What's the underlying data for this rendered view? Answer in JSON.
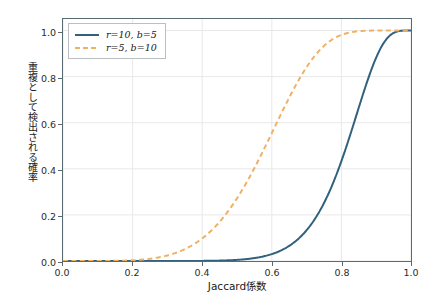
{
  "chart_data": {
    "type": "line",
    "title": "",
    "xlabel": "Jaccard係数",
    "ylabel": "重複として検出される確率",
    "xlim": [
      0.0,
      1.0
    ],
    "ylim": [
      0.0,
      1.05
    ],
    "grid": true,
    "legend_position": "upper left",
    "xticks": [
      "0.0",
      "0.2",
      "0.4",
      "0.6",
      "0.8",
      "1.0"
    ],
    "xtick_values": [
      0.0,
      0.2,
      0.4,
      0.6,
      0.8,
      1.0
    ],
    "yticks": [
      "0.0",
      "0.2",
      "0.4",
      "0.6",
      "0.8",
      "1.0"
    ],
    "ytick_values": [
      0.0,
      0.2,
      0.4,
      0.6,
      0.8,
      1.0
    ],
    "x": [
      0.0,
      0.05,
      0.1,
      0.15,
      0.2,
      0.25,
      0.3,
      0.35,
      0.4,
      0.45,
      0.5,
      0.55,
      0.6,
      0.65,
      0.7,
      0.75,
      0.8,
      0.85,
      0.9,
      0.95,
      1.0
    ],
    "series": [
      {
        "name": "r=10, b=5",
        "label": "r=10, b=5",
        "color": "#31617d",
        "linestyle": "solid",
        "linewidth": 2.0,
        "formula": "1-(1-s^10)^5",
        "threshold": 0.85,
        "values": [
          0.0,
          0.0,
          0.0,
          0.0,
          0.0,
          0.0,
          0.0,
          0.0,
          0.001,
          0.002,
          0.005,
          0.012,
          0.03,
          0.066,
          0.133,
          0.248,
          0.423,
          0.648,
          0.87,
          0.987,
          1.0
        ]
      },
      {
        "name": "r=5, b=10",
        "label": "r=5, b=10",
        "color": "#f0b163",
        "linestyle": "dashed",
        "linewidth": 2.0,
        "formula": "1-(1-s^5)^10",
        "threshold": 0.63,
        "values": [
          0.0,
          0.0,
          0.0,
          0.001,
          0.003,
          0.01,
          0.024,
          0.051,
          0.097,
          0.169,
          0.271,
          0.404,
          0.556,
          0.708,
          0.838,
          0.928,
          0.977,
          0.996,
          1.0,
          1.0,
          1.0
        ]
      }
    ]
  },
  "legend": {
    "entries": [
      {
        "label": "r=10, b=5",
        "color": "#31617d",
        "style": "solid"
      },
      {
        "label": "r=5, b=10",
        "color": "#f0b163",
        "style": "dashed"
      }
    ]
  },
  "axes": {
    "x_title": "Jaccard係数",
    "y_title": "重複として検出される確率",
    "x_tick_0": "0.0",
    "x_tick_1": "0.2",
    "x_tick_2": "0.4",
    "x_tick_3": "0.6",
    "x_tick_4": "0.8",
    "x_tick_5": "1.0",
    "y_tick_0": "0.0",
    "y_tick_1": "0.2",
    "y_tick_2": "0.4",
    "y_tick_3": "0.6",
    "y_tick_4": "0.8",
    "y_tick_5": "1.0"
  },
  "colors": {
    "series_1": "#31617d",
    "series_2": "#f0b163",
    "grid": "#e8e8e8",
    "frame": "#5a6a72",
    "background": "#ffffff",
    "text": "#1a1a1a"
  }
}
